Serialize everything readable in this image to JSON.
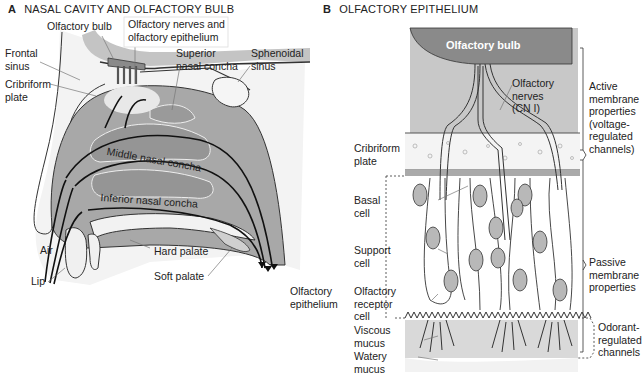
{
  "panel_a": {
    "letter": "A",
    "title": "NASAL CAVITY AND OLFACTORY BULB",
    "labels": {
      "olfactory_bulb": "Olfactory bulb",
      "olfactory_nerves_epithelium": "Olfactory nerves and\nolfactory epithelium",
      "frontal_sinus": "Frontal\nsinus",
      "cribriform_plate": "Cribriform\nplate",
      "superior_concha": "Superior\nnasal concha",
      "sphenoidal_sinus": "Sphenoidal\nsinus",
      "middle_concha": "Middle nasal concha",
      "inferior_concha": "Inferior nasal concha",
      "air": "Air",
      "lip": "Lip",
      "hard_palate": "Hard palate",
      "soft_palate": "Soft palate"
    }
  },
  "panel_b": {
    "letter": "B",
    "title": "OLFACTORY EPITHELIUM",
    "labels": {
      "olfactory_bulb": "Olfactory bulb",
      "olfactory_nerves": "Olfactory\nnerves\n(CN I)",
      "cribriform_plate": "Cribriform\nplate",
      "basal_cell": "Basal\ncell",
      "support_cell": "Support\ncell",
      "olfactory_epithelium": "Olfactory\nepithelium",
      "olfactory_receptor_cell": "Olfactory\nreceptor\ncell",
      "viscous_mucus": "Viscous\nmucus",
      "watery_mucus": "Watery\nmucus",
      "active_membrane": "Active\nmembrane\nproperties\n(voltage-\nregulated\nchannels)",
      "passive_membrane": "Passive\nmembrane\nproperties",
      "odorant_regulated": "Odorant-\nregulated\nchannels"
    }
  },
  "colors": {
    "dark_gray": "#8a8a8a",
    "mid_gray": "#b5b5b5",
    "light_gray": "#d9d9d9",
    "line": "#222222"
  }
}
